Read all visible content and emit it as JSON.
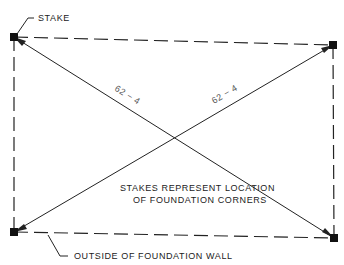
{
  "diagram": {
    "labels": {
      "stake": "STAKE",
      "wall": "OUTSIDE OF FOUNDATION WALL",
      "note_line1": "STAKES REPRESENT LOCATION",
      "note_line2": "OF FOUNDATION CORNERS"
    },
    "diagonals": {
      "dim_a": "62 − 4",
      "dim_b": "62 − 4"
    },
    "corners": [
      {
        "name": "top-left",
        "x": 14,
        "y": 37
      },
      {
        "name": "top-right",
        "x": 333,
        "y": 45
      },
      {
        "name": "bottom-left",
        "x": 14,
        "y": 232
      },
      {
        "name": "bottom-right",
        "x": 334,
        "y": 238
      }
    ],
    "colors": {
      "line": "#222222",
      "text": "#222222"
    }
  }
}
